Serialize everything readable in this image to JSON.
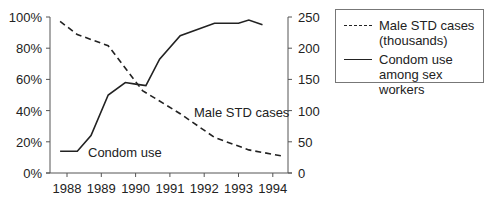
{
  "chart_data": {
    "type": "line",
    "title": "",
    "xlabel": "",
    "ylabel_left": "",
    "ylabel_right": "",
    "x_ticks": [
      "1988",
      "1989",
      "1990",
      "1991",
      "1992",
      "1993",
      "1994"
    ],
    "y_left_ticks": [
      "0%",
      "20%",
      "40%",
      "60%",
      "80%",
      "100%"
    ],
    "y_left_range": [
      0,
      100
    ],
    "y_right_ticks": [
      "0",
      "50",
      "100",
      "150",
      "200",
      "250"
    ],
    "y_right_range": [
      0,
      250
    ],
    "grid": false,
    "legend_position": "top-right, outside plot",
    "series": [
      {
        "name": "Male STD cases (thousands)",
        "axis": "right",
        "style": "dashed",
        "x": [
          1987.8,
          1988.3,
          1989.2,
          1990.2,
          1991.3,
          1992.3,
          1993.3,
          1994.3
        ],
        "values": [
          243,
          222,
          204,
          132,
          95,
          57,
          37,
          27
        ]
      },
      {
        "name": "Condom use among sex workers",
        "axis": "left",
        "style": "solid",
        "x": [
          1987.8,
          1988.3,
          1988.7,
          1989.2,
          1989.7,
          1990.0,
          1990.3,
          1990.7,
          1991.3,
          1992.3,
          1993.0,
          1993.3,
          1993.7
        ],
        "values": [
          14,
          14,
          24,
          50,
          58,
          57,
          56,
          73,
          88,
          96,
          96,
          98,
          95
        ]
      }
    ],
    "annotations": [
      "Male STD cases",
      "Condom use"
    ]
  },
  "legend": {
    "items": [
      {
        "label": "Male STD cases (thousands)",
        "style": "dashed"
      },
      {
        "label": "Condom use among sex workers",
        "style": "solid"
      }
    ]
  },
  "annotations": {
    "std": "Male STD cases",
    "condom": "Condom use"
  }
}
